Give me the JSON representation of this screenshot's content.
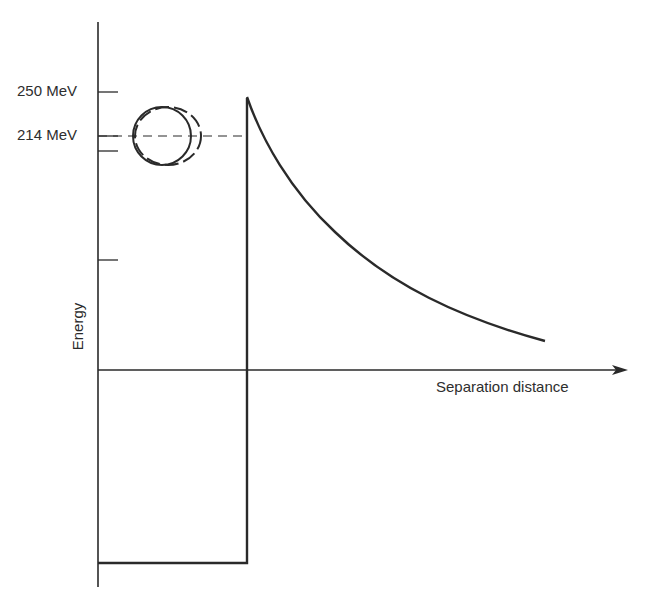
{
  "diagram": {
    "type": "potential-energy-vs-separation",
    "axes": {
      "y_label": "Energy",
      "x_label": "Separation distance"
    },
    "y_ticks": [
      {
        "label": "250 MeV",
        "y": 92
      },
      {
        "label": "214 MeV",
        "y": 136
      },
      {
        "label": "",
        "y": 151
      },
      {
        "label": "",
        "y": 260
      }
    ],
    "annotations": {
      "dashed_line_level": "214 MeV",
      "nucleus_symbol": "deformed nucleus (solid circle with dashed elongated outline)"
    },
    "curve": {
      "description": "Coulomb repulsion decaying with separation distance, peak near 250 MeV at barrier wall",
      "shape": "1/r decay"
    },
    "well": {
      "description": "Square potential well below zero, bounded by vertical wall at barrier"
    },
    "colors": {
      "line": "#2a2a2a",
      "background": "#ffffff"
    }
  }
}
